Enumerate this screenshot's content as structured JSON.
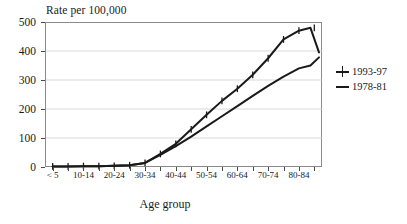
{
  "chart_data": {
    "type": "line",
    "title": "",
    "ylabel": "Rate per 100,000",
    "xlabel": "Age group",
    "ylim": [
      0,
      500
    ],
    "yticks": [
      0,
      100,
      200,
      300,
      400,
      500
    ],
    "grid": true,
    "legend_position": "right",
    "categories": [
      "< 5",
      "5-9",
      "10-14",
      "15-19",
      "20-24",
      "25-29",
      "30-34",
      "35-39",
      "40-44",
      "45-49",
      "50-54",
      "55-59",
      "60-64",
      "65-69",
      "70-74",
      "75-79",
      "80-84",
      "85+"
    ],
    "tick_labels_shown": [
      "< 5",
      "",
      "10-14",
      "",
      "20-24",
      "",
      "30-34",
      "",
      "40-44",
      "",
      "50-54",
      "",
      "60-64",
      "",
      "70-74",
      "",
      "80-84",
      ""
    ],
    "series": [
      {
        "name": "1993-97",
        "marker": "cross",
        "values": [
          2,
          2,
          3,
          3,
          4,
          6,
          14,
          45,
          80,
          130,
          180,
          228,
          270,
          318,
          375,
          440,
          470,
          480
        ]
      },
      {
        "name": "1978-81",
        "marker": "none",
        "values": [
          2,
          2,
          3,
          3,
          4,
          6,
          14,
          42,
          72,
          105,
          140,
          175,
          210,
          245,
          280,
          312,
          340,
          350
        ]
      }
    ],
    "series_tail": [
      {
        "name": "1993-97",
        "final_value": 395
      },
      {
        "name": "1978-81",
        "final_value": 378
      }
    ]
  },
  "legend": {
    "items": [
      {
        "label": "1993-97",
        "symbol": "cross-marker-icon"
      },
      {
        "label": "1978-81",
        "symbol": "line-marker-icon"
      }
    ]
  }
}
